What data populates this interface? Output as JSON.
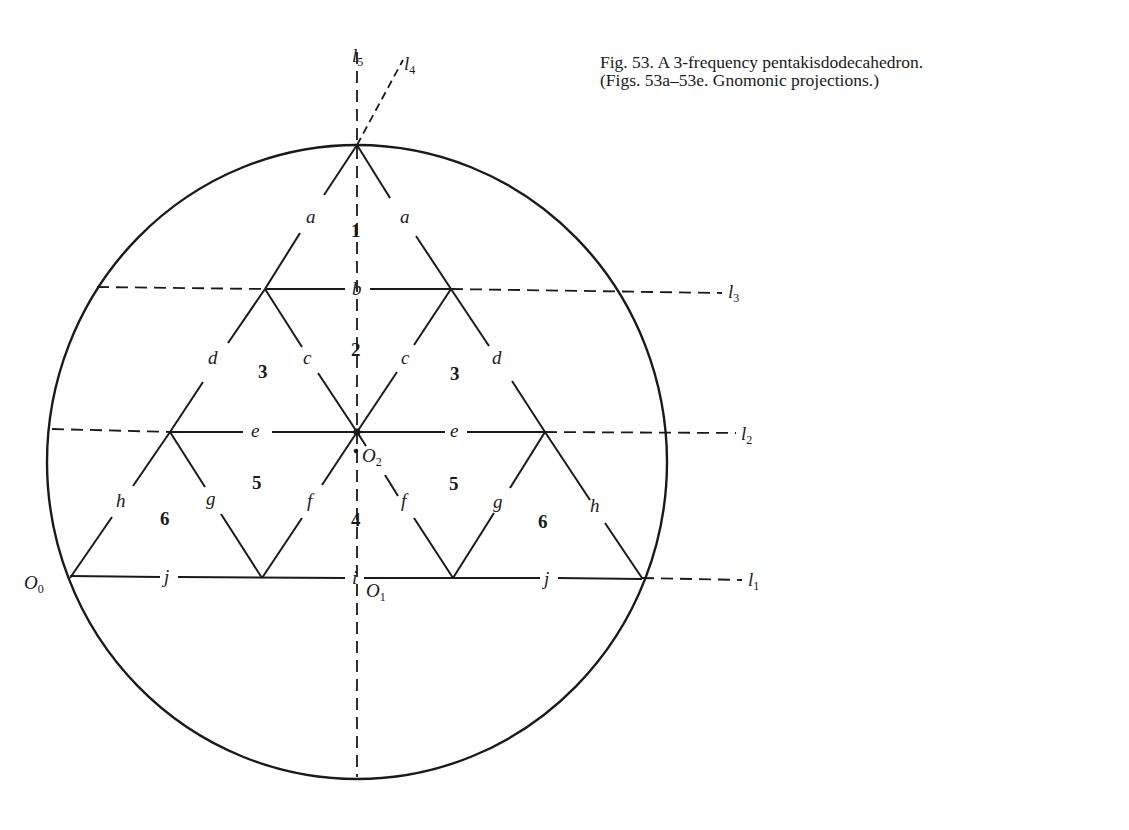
{
  "caption": {
    "line1": "Fig. 53. A 3-frequency pentakisdodecahedron.",
    "line2": "(Figs. 53a–53e. Gnomonic projections.)"
  },
  "diagram": {
    "colors": {
      "stroke": "#1a1a1a",
      "background": "#ffffff"
    },
    "circle": {
      "cx": 357,
      "cy": 462,
      "rx": 310,
      "ry": 317
    },
    "reference_lines": [
      {
        "id": "l1",
        "name": "l",
        "sub": "1",
        "style": "horizontal-dashed"
      },
      {
        "id": "l2",
        "name": "l",
        "sub": "2",
        "style": "horizontal-dashed"
      },
      {
        "id": "l3",
        "name": "l",
        "sub": "3",
        "style": "horizontal-dashed"
      },
      {
        "id": "l4",
        "name": "l",
        "sub": "4",
        "style": "oblique-dashed"
      },
      {
        "id": "l5",
        "name": "l",
        "sub": "5",
        "style": "vertical-dashed"
      }
    ],
    "points": [
      {
        "id": "O0",
        "name": "O",
        "sub": "0"
      },
      {
        "id": "O1",
        "name": "O",
        "sub": "1"
      },
      {
        "id": "O2",
        "name": "O",
        "sub": "2"
      }
    ],
    "edge_labels": {
      "a_left": "a",
      "a_right": "a",
      "b": "b",
      "c_left": "c",
      "c_right": "c",
      "d_left": "d",
      "d_right": "d",
      "e_left": "e",
      "e_right": "e",
      "f_left": "f",
      "f_right": "f",
      "g_left": "g",
      "g_right": "g",
      "h_left": "h",
      "h_right": "h",
      "i": "i",
      "j_left": "j",
      "j_right": "j"
    },
    "region_labels": {
      "r1": "1",
      "r2": "2",
      "r3_left": "3",
      "r3_right": "3",
      "r4": "4",
      "r5_left": "5",
      "r5_right": "5",
      "r6_left": "6",
      "r6_right": "6"
    }
  }
}
